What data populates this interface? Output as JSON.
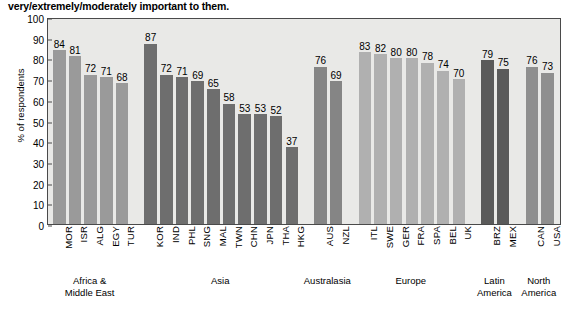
{
  "chart_data": {
    "type": "bar",
    "title": "very/extremely/moderately important to them.",
    "xlabel": "",
    "ylabel": "% of respondents",
    "ylim": [
      0,
      100
    ],
    "yticks": [
      0,
      10,
      20,
      30,
      40,
      50,
      60,
      70,
      80,
      90,
      100
    ],
    "grid": false,
    "legend": "none",
    "categories": [
      "MOR",
      "ISR",
      "ALG",
      "EGY",
      "TUR",
      "KOR",
      "IND",
      "PHL",
      "SNG",
      "MAL",
      "TWN",
      "CHN",
      "JPN",
      "THA",
      "HKG",
      "AUS",
      "NZL",
      "ITL",
      "SWE",
      "GER",
      "FRA",
      "SPA",
      "BEL",
      "UK",
      "BRZ",
      "MEX",
      "CAN",
      "USA"
    ],
    "values": [
      84,
      81,
      72,
      71,
      68,
      87,
      72,
      71,
      69,
      65,
      58,
      53,
      53,
      52,
      37,
      76,
      69,
      83,
      82,
      80,
      80,
      78,
      74,
      70,
      79,
      75,
      76,
      73
    ],
    "groups": [
      {
        "label_lines": [
          "Africa &",
          "Middle East"
        ],
        "start": 0,
        "count": 5,
        "color": "#9a9a9a"
      },
      {
        "label_lines": [
          "Asia"
        ],
        "start": 5,
        "count": 10,
        "color": "#6e6e6e"
      },
      {
        "label_lines": [
          "Australasia"
        ],
        "start": 15,
        "count": 2,
        "color": "#858585"
      },
      {
        "label_lines": [
          "Europe"
        ],
        "start": 17,
        "count": 7,
        "color": "#b0b0b0"
      },
      {
        "label_lines": [
          "Latin",
          "America"
        ],
        "start": 24,
        "count": 2,
        "color": "#5a5a5a"
      },
      {
        "label_lines": [
          "North",
          "America"
        ],
        "start": 26,
        "count": 2,
        "color": "#8f8f8f"
      }
    ]
  },
  "colors": {
    "plot_background": "#e9e9e7",
    "axis": "#4a4a4a",
    "text": "#000000",
    "page_background": "#ffffff"
  }
}
